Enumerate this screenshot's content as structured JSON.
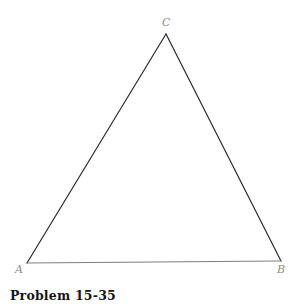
{
  "figure": {
    "caption": "Problem 15-35",
    "background_color": "#ffffff",
    "width": 302,
    "height": 308,
    "shape": "triangle",
    "vertices": [
      {
        "id": "C",
        "label": "C",
        "x": 166,
        "y": 34,
        "role": "apex"
      },
      {
        "id": "A",
        "label": "A",
        "x": 27,
        "y": 263,
        "role": "bottom-left"
      },
      {
        "id": "B",
        "label": "B",
        "x": 281,
        "y": 261,
        "role": "bottom-right"
      }
    ],
    "edges": [
      {
        "id": "AC",
        "from": "A",
        "to": "C",
        "color": "#2a2a2a",
        "width": 1.2
      },
      {
        "id": "CB",
        "from": "C",
        "to": "B",
        "color": "#2a2a2a",
        "width": 1.2
      },
      {
        "id": "AB",
        "from": "A",
        "to": "B",
        "color": "#7d7d7d",
        "width": 1.0
      }
    ],
    "label_color": "#8d8d8d",
    "caption_color": "#161616"
  }
}
